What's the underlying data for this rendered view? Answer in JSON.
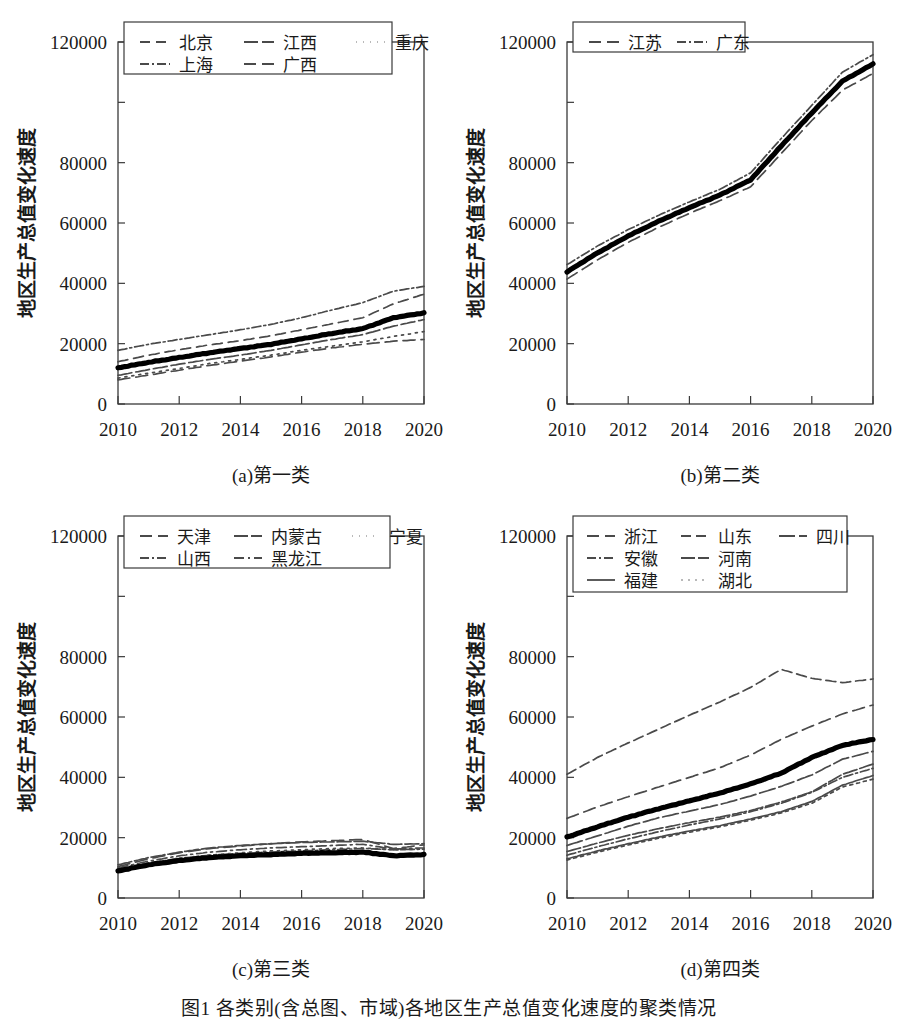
{
  "figure": {
    "caption": "图1  各类别(含总图、市域)各地区生产总值变化速度的聚类情况",
    "axis": {
      "ylabel": "地区生产总值变化速度",
      "yticks": [
        0,
        20000,
        40000,
        60000,
        80000,
        100000,
        120000
      ],
      "ytick_labels": [
        "0",
        "20000",
        "40000",
        "60000",
        "80000",
        "",
        "120000"
      ],
      "ylim": [
        0,
        120000
      ],
      "xticks": [
        2010,
        2012,
        2014,
        2016,
        2018,
        2020
      ],
      "xtick_labels": [
        "2010",
        "2012",
        "2014",
        "2016",
        "2018",
        "2020"
      ],
      "xlim": [
        2010,
        2020
      ]
    },
    "panels": [
      {
        "id": "a",
        "caption": "(a)第一类"
      },
      {
        "id": "b",
        "caption": "(b)第二类"
      },
      {
        "id": "c",
        "caption": "(c)第三类"
      },
      {
        "id": "d",
        "caption": "(d)第四类"
      }
    ]
  },
  "chart_data": [
    {
      "panel": "a",
      "type": "line",
      "title": "(a)第一类",
      "xlabel": "",
      "ylabel": "地区生产总值变化速度",
      "xlim": [
        2010,
        2020
      ],
      "ylim": [
        0,
        120000
      ],
      "grid": false,
      "legend_position": "top-inside",
      "x": [
        2010,
        2011,
        2012,
        2013,
        2014,
        2015,
        2016,
        2017,
        2018,
        2019,
        2020
      ],
      "series": [
        {
          "name": "北京",
          "dash": "10 6",
          "values": [
            14000,
            16200,
            18000,
            19600,
            21000,
            22600,
            24600,
            26600,
            28600,
            33200,
            36400
          ]
        },
        {
          "name": "江西",
          "dash": "14 4",
          "values": [
            9500,
            11400,
            13200,
            14800,
            16200,
            17800,
            19600,
            21400,
            23000,
            25800,
            28000
          ]
        },
        {
          "name": "重庆",
          "dash": "2 5",
          "values": [
            8600,
            10200,
            11800,
            13400,
            14800,
            16200,
            17800,
            19200,
            20600,
            22400,
            24000
          ]
        },
        {
          "name": "上海",
          "dash": "9 3 2 3",
          "values": [
            17800,
            19800,
            21400,
            23000,
            24600,
            26400,
            28600,
            31200,
            33600,
            37400,
            39000
          ]
        },
        {
          "name": "广西",
          "dash": "12 6",
          "values": [
            8000,
            9600,
            11200,
            12800,
            14200,
            15600,
            17200,
            18600,
            19800,
            20800,
            21400
          ]
        },
        {
          "name": "类均值",
          "dash": "none",
          "bold": true,
          "values": [
            12000,
            13800,
            15400,
            17000,
            18400,
            19800,
            21600,
            23400,
            25000,
            28600,
            30200
          ]
        }
      ],
      "legend": [
        {
          "label": "北京",
          "dash": "10 6"
        },
        {
          "label": "江西",
          "dash": "14 4"
        },
        {
          "label": "重庆",
          "dash": "1 6"
        },
        {
          "label": "上海",
          "dash": "9 3 2 3"
        },
        {
          "label": "广西",
          "dash": "12 6"
        }
      ]
    },
    {
      "panel": "b",
      "type": "line",
      "title": "(b)第二类",
      "xlabel": "",
      "ylabel": "地区生产总值变化速度",
      "xlim": [
        2010,
        2020
      ],
      "ylim": [
        0,
        120000
      ],
      "grid": false,
      "legend_position": "top-inside",
      "x": [
        2010,
        2011,
        2012,
        2013,
        2014,
        2015,
        2016,
        2017,
        2018,
        2019,
        2020
      ],
      "series": [
        {
          "name": "江苏",
          "dash": "12 6",
          "values": [
            41400,
            47800,
            53600,
            58600,
            63200,
            67400,
            72000,
            83000,
            94000,
            104000,
            109600
          ]
        },
        {
          "name": "广东",
          "dash": "9 3 2 3",
          "values": [
            46200,
            52400,
            57800,
            62600,
            67000,
            71200,
            76600,
            88000,
            99000,
            110000,
            115800
          ]
        },
        {
          "name": "类均值",
          "dash": "none",
          "bold": true,
          "values": [
            43800,
            50100,
            55700,
            60600,
            65100,
            69300,
            74300,
            85500,
            96500,
            107000,
            112700
          ]
        }
      ],
      "legend": [
        {
          "label": "江苏",
          "dash": "12 6"
        },
        {
          "label": "广东",
          "dash": "9 3 2 3"
        }
      ]
    },
    {
      "panel": "c",
      "type": "line",
      "title": "(c)第三类",
      "xlabel": "",
      "ylabel": "地区生产总值变化速度",
      "xlim": [
        2010,
        2020
      ],
      "ylim": [
        0,
        120000
      ],
      "grid": false,
      "legend_position": "top-inside",
      "x": [
        2010,
        2011,
        2012,
        2013,
        2014,
        2015,
        2016,
        2017,
        2018,
        2019,
        2020
      ],
      "series": [
        {
          "name": "天津",
          "dash": "12 6",
          "values": [
            10400,
            13000,
            15000,
            16400,
            17200,
            18000,
            18600,
            19000,
            19400,
            16400,
            17600
          ]
        },
        {
          "name": "内蒙古",
          "dash": "14 3",
          "values": [
            11000,
            13400,
            15200,
            16600,
            17400,
            18000,
            18400,
            18600,
            18800,
            17800,
            18000
          ]
        },
        {
          "name": "宁夏",
          "dash": "2 5",
          "values": [
            9200,
            11200,
            13000,
            14200,
            15000,
            15600,
            16000,
            16400,
            16600,
            16000,
            16200
          ]
        },
        {
          "name": "山西",
          "dash": "9 3 2 3",
          "values": [
            9600,
            11600,
            13200,
            14200,
            14800,
            15200,
            15600,
            16000,
            16400,
            16000,
            16200
          ]
        },
        {
          "name": "黑龙江",
          "dash": "10 4 2 4",
          "values": [
            10000,
            12200,
            14000,
            15200,
            16000,
            16600,
            17000,
            17400,
            17800,
            16200,
            16600
          ]
        },
        {
          "name": "类均值",
          "dash": "none",
          "bold": true,
          "values": [
            9000,
            11000,
            12400,
            13400,
            14000,
            14400,
            14800,
            15000,
            15200,
            14000,
            14400
          ]
        }
      ],
      "legend": [
        {
          "label": "天津",
          "dash": "12 6"
        },
        {
          "label": "内蒙古",
          "dash": "14 3"
        },
        {
          "label": "宁夏",
          "dash": "1 6"
        },
        {
          "label": "山西",
          "dash": "9 3 2 3"
        },
        {
          "label": "黑龙江",
          "dash": "10 4 2 4"
        }
      ]
    },
    {
      "panel": "d",
      "type": "line",
      "title": "(d)第四类",
      "xlabel": "",
      "ylabel": "地区生产总值变化速度",
      "xlim": [
        2010,
        2020
      ],
      "ylim": [
        0,
        120000
      ],
      "grid": false,
      "legend_position": "top-inside",
      "x": [
        2010,
        2011,
        2012,
        2013,
        2014,
        2015,
        2016,
        2017,
        2018,
        2019,
        2020
      ],
      "series": [
        {
          "name": "浙江",
          "dash": "12 6",
          "values": [
            26400,
            30200,
            33600,
            36800,
            40000,
            43200,
            47400,
            52600,
            57000,
            61000,
            64000
          ]
        },
        {
          "name": "山东",
          "dash": "10 5",
          "values": [
            41000,
            46600,
            51400,
            56000,
            60600,
            65000,
            69800,
            75800,
            72800,
            71400,
            72600
          ]
        },
        {
          "name": "四川",
          "dash": "16 4",
          "values": [
            17400,
            20600,
            23800,
            26600,
            28800,
            31000,
            33800,
            37000,
            40800,
            46000,
            48600
          ]
        },
        {
          "name": "安徽",
          "dash": "9 3 2 3",
          "values": [
            14200,
            17000,
            19600,
            22000,
            24200,
            26200,
            28600,
            31400,
            35000,
            40000,
            43000
          ]
        },
        {
          "name": "河南",
          "dash": "14 3",
          "values": [
            15400,
            18200,
            20800,
            23000,
            25000,
            26800,
            29000,
            31800,
            35200,
            41000,
            44400
          ]
        },
        {
          "name": "福建",
          "dash": "none",
          "values": [
            13000,
            15600,
            18000,
            20200,
            22200,
            24000,
            26200,
            28600,
            32000,
            37400,
            40600
          ]
        },
        {
          "name": "湖北",
          "dash": "3 4",
          "values": [
            12600,
            15200,
            17600,
            19800,
            21800,
            23600,
            25800,
            28200,
            31400,
            36800,
            39400
          ]
        },
        {
          "name": "类均值",
          "dash": "none",
          "bold": true,
          "values": [
            20200,
            23600,
            26800,
            29600,
            32200,
            34800,
            37800,
            41400,
            46600,
            50600,
            52600
          ]
        }
      ],
      "legend": [
        {
          "label": "浙江",
          "dash": "12 6"
        },
        {
          "label": "山东",
          "dash": "10 5"
        },
        {
          "label": "四川",
          "dash": "16 4"
        },
        {
          "label": "安徽",
          "dash": "9 3 2 3"
        },
        {
          "label": "河南",
          "dash": "14 3"
        },
        {
          "label": "福建",
          "dash": "none"
        },
        {
          "label": "湖北",
          "dash": "2 5"
        }
      ]
    }
  ]
}
